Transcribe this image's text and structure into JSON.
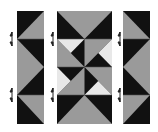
{
  "diagram": {
    "colors": {
      "dark": "#111111",
      "medium": "#9a9a9a",
      "light": "#e8e8e8",
      "background": "#ffffff"
    },
    "strips": [
      {
        "name": "left-strip",
        "units": [
          "half-square triangle",
          "flying-geese pair",
          "half-square triangle"
        ]
      },
      {
        "name": "center-strip",
        "units": [
          "flying geese (down)",
          "pinwheel 2x2",
          "flying geese (up)"
        ]
      },
      {
        "name": "right-strip",
        "units": [
          "half-square triangle",
          "flying-geese pair",
          "half-square triangle"
        ]
      }
    ],
    "arrows": [
      {
        "x": 12,
        "y": 39,
        "type": "press-up-down"
      },
      {
        "x": 12,
        "y": 95,
        "type": "press-up-down"
      },
      {
        "x": 53,
        "y": 39,
        "type": "press-up-down"
      },
      {
        "x": 53,
        "y": 95,
        "type": "press-up-down"
      },
      {
        "x": 120,
        "y": 39,
        "type": "press-up-down"
      },
      {
        "x": 120,
        "y": 95,
        "type": "press-up-down"
      }
    ]
  }
}
